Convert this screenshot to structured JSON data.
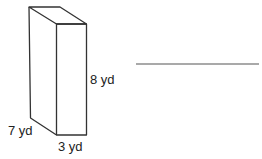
{
  "figure": {
    "type": "rectangular-prism",
    "labels": {
      "height": "8 yd",
      "depth": "7 yd",
      "width": "3 yd"
    },
    "answer_line": ""
  },
  "colors": {
    "stroke": "#333333",
    "text": "#222222",
    "background": "#ffffff"
  }
}
